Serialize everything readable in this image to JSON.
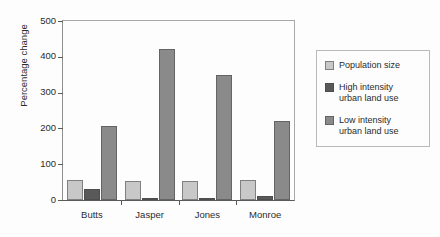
{
  "chart_data": {
    "type": "bar",
    "title": "",
    "xlabel": "",
    "ylabel": "Percentage change",
    "ylim": [
      0,
      500
    ],
    "yticks": [
      0,
      100,
      200,
      300,
      400,
      500
    ],
    "grid": false,
    "legend_position": "right",
    "categories": [
      "Butts",
      "Jasper",
      "Jones",
      "Monroe"
    ],
    "series": [
      {
        "name": "Population size",
        "color": "#c8c8c8",
        "values": [
          55,
          52,
          53,
          55
        ]
      },
      {
        "name": "High intensity urban land use",
        "color": "#595959",
        "values": [
          30,
          5,
          7,
          12
        ]
      },
      {
        "name": "Low intensity urban land use",
        "color": "#8a8a8a",
        "values": [
          207,
          422,
          348,
          222
        ]
      }
    ]
  },
  "legend": {
    "entries": [
      {
        "label": "Population size"
      },
      {
        "label": "High intensity\nurban land use"
      },
      {
        "label": "Low intensity\nurban land use"
      }
    ]
  }
}
